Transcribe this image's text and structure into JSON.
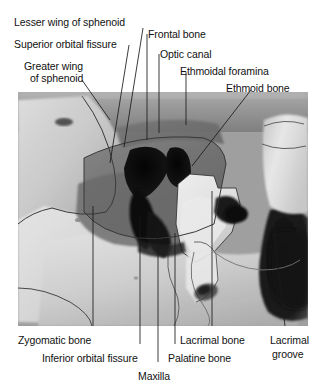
{
  "figure": {
    "image_alt_name": "orbit-photograph",
    "background_color": "#ffffff",
    "leader_line_color": "#1a1a1a",
    "photo_frame": {
      "x": 18,
      "y": 92,
      "width": 290,
      "height": 234
    }
  },
  "labels": {
    "top": [
      {
        "id": "lesser-wing-of-sphenoid",
        "text": "Lesser wing of sphenoid",
        "x": 14,
        "y": 16
      },
      {
        "id": "superior-orbital-fissure",
        "text": "Superior orbital fissure",
        "x": 14,
        "y": 38
      },
      {
        "id": "greater-wing-of-sphenoid-line1",
        "text": "Greater wing",
        "x": 24,
        "y": 60
      },
      {
        "id": "greater-wing-of-sphenoid-line2",
        "text": "of sphenoid",
        "x": 30,
        "y": 72
      },
      {
        "id": "frontal-bone",
        "text": "Frontal bone",
        "x": 148,
        "y": 28
      },
      {
        "id": "optic-canal",
        "text": "Optic canal",
        "x": 160,
        "y": 48
      },
      {
        "id": "ethmoidal-foramina",
        "text": "Ethmoidal foramina",
        "x": 180,
        "y": 65
      },
      {
        "id": "ethmoid-bone",
        "text": "Ethmoid bone",
        "x": 226,
        "y": 82
      }
    ],
    "bottom": [
      {
        "id": "zygomatic-bone",
        "text": "Zygomatic bone",
        "x": 18,
        "y": 334
      },
      {
        "id": "inferior-orbital-fissure",
        "text": "Inferior orbital fissure",
        "x": 42,
        "y": 352
      },
      {
        "id": "maxilla",
        "text": "Maxilla",
        "x": 138,
        "y": 370
      },
      {
        "id": "palatine-bone",
        "text": "Palatine bone",
        "x": 168,
        "y": 352
      },
      {
        "id": "lacrimal-bone",
        "text": "Lacrimal bone",
        "x": 180,
        "y": 334
      },
      {
        "id": "lacrimal-groove-line1",
        "text": "Lacrimal",
        "x": 270,
        "y": 334
      },
      {
        "id": "lacrimal-groove-line2",
        "text": "groove",
        "x": 272,
        "y": 348
      }
    ]
  },
  "leader_lines": [
    {
      "id": "leader-lesser-wing-of-sphenoid",
      "x1": 143,
      "y1": 28,
      "x2": 124,
      "y2": 147
    },
    {
      "id": "leader-superior-orbital-fissure",
      "x1": 129,
      "y1": 45,
      "x2": 110,
      "y2": 163
    },
    {
      "id": "leader-greater-wing-of-sphenoid",
      "x1": 82,
      "y1": 80,
      "x2": 110,
      "y2": 120
    },
    {
      "id": "leader-frontal-bone",
      "x1": 147,
      "y1": 34,
      "x2": 147,
      "y2": 140
    },
    {
      "id": "leader-optic-canal",
      "x1": 159,
      "y1": 54,
      "x2": 159,
      "y2": 133
    },
    {
      "id": "leader-ethmoidal-foramina",
      "x1": 186,
      "y1": 72,
      "x2": 186,
      "y2": 125
    },
    {
      "id": "leader-ethmoid-bone",
      "x1": 251,
      "y1": 90,
      "x2": 192,
      "y2": 166
    },
    {
      "id": "leader-zygomatic-bone",
      "x1": 93,
      "y1": 326,
      "x2": 93,
      "y2": 206
    },
    {
      "id": "leader-inferior-orbital-fissure",
      "x1": 140,
      "y1": 344,
      "x2": 140,
      "y2": 216
    },
    {
      "id": "leader-maxilla",
      "x1": 158,
      "y1": 362,
      "x2": 158,
      "y2": 228
    },
    {
      "id": "leader-palatine-bone",
      "x1": 175,
      "y1": 344,
      "x2": 175,
      "y2": 233
    },
    {
      "id": "leader-lacrimal-bone",
      "x1": 212,
      "y1": 326,
      "x2": 212,
      "y2": 191
    },
    {
      "id": "leader-lacrimal-groove",
      "x1": 285,
      "y1": 326,
      "x2": 272,
      "y2": 214
    }
  ]
}
